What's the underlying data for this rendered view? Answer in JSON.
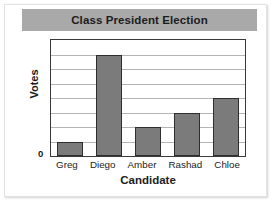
{
  "chart_data": {
    "type": "bar",
    "title": "Class President Election",
    "xlabel": "Candidate",
    "ylabel": "Votes",
    "categories": [
      "Greg",
      "Diego",
      "Amber",
      "Rashad",
      "Chloe"
    ],
    "values": [
      1,
      7,
      2,
      3,
      4
    ],
    "ylim": [
      0,
      8
    ],
    "y_tick_labels": [
      "0"
    ],
    "gridlines": 7,
    "grid": true,
    "legend": "none",
    "bar_color": "#7b7b7b",
    "bar_border_color": "#2e2e2e",
    "title_banner_color": "#a9a9a9",
    "gridline_color": "#b4b4b4",
    "axis_color": "#3a3a3a"
  }
}
